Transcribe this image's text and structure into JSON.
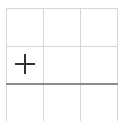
{
  "board": {
    "rows": 3,
    "cols": 3,
    "grid_color": "#d6d6d6",
    "divider_color": "#8c8c8c",
    "mark_color": "#333333",
    "cells": [
      {
        "row": 0,
        "col": 0,
        "mark": ""
      },
      {
        "row": 0,
        "col": 1,
        "mark": ""
      },
      {
        "row": 0,
        "col": 2,
        "mark": ""
      },
      {
        "row": 1,
        "col": 0,
        "mark": "plus-icon"
      },
      {
        "row": 1,
        "col": 1,
        "mark": ""
      },
      {
        "row": 1,
        "col": 2,
        "mark": ""
      },
      {
        "row": 2,
        "col": 0,
        "mark": ""
      },
      {
        "row": 2,
        "col": 1,
        "mark": ""
      },
      {
        "row": 2,
        "col": 2,
        "mark": ""
      }
    ]
  }
}
